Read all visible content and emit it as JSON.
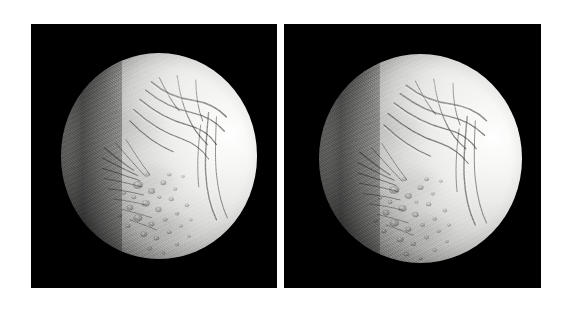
{
  "figure": {
    "background_color": "#ffffff",
    "layout": "two-panel-side-by-side",
    "panel_gap_color": "#ffffff",
    "panel_count": 2
  },
  "panels": [
    {
      "id": "left-panel",
      "name": "left-image",
      "background_color": "#000000",
      "x": 31,
      "y": 24,
      "width": 246,
      "height": 264,
      "subject": {
        "name": "icy-moon",
        "body": "Enceladus",
        "phase": "gibbous",
        "illumination_direction": "right",
        "terminator_side": "left",
        "center_x_pct": 52,
        "center_y_pct": 50,
        "diameter_x_pct": 80,
        "diameter_y_pct": 78,
        "surface_color_bright": "#ffffff",
        "surface_color_mid": "#c8c8c6",
        "surface_color_shadow": "#050505",
        "features": [
          "grooved-terrain",
          "linear-fractures",
          "cratered-plains",
          "bright-limb",
          "dark-terminator"
        ]
      }
    },
    {
      "id": "right-panel",
      "name": "right-image",
      "background_color": "#000000",
      "x": 284,
      "y": 24,
      "width": 257,
      "height": 264,
      "subject": {
        "name": "icy-moon",
        "body": "Enceladus",
        "phase": "gibbous",
        "illumination_direction": "right",
        "terminator_side": "left",
        "center_x_pct": 53,
        "center_y_pct": 51,
        "diameter_x_pct": 79,
        "diameter_y_pct": 79,
        "surface_color_bright": "#ffffff",
        "surface_color_mid": "#c8c8c6",
        "surface_color_shadow": "#050505",
        "features": [
          "grooved-terrain",
          "linear-fractures",
          "cratered-plains",
          "bright-limb",
          "dark-terminator"
        ]
      }
    }
  ]
}
